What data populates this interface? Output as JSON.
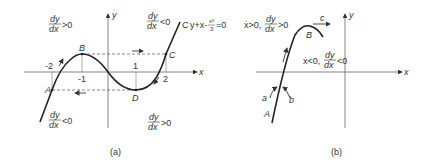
{
  "figure_a": {
    "caption": "(a)",
    "axis_x": "x",
    "axis_y": "y",
    "ticks": [
      "-2",
      "-1",
      "1",
      "2"
    ],
    "points": [
      "A",
      "B",
      "C",
      "D"
    ],
    "curve_label": "C: y+x-x³/3=0",
    "curve_symbol": "C",
    "equation_text": "y+x-",
    "equation_frac_num": "x³",
    "equation_frac_den": "3",
    "equation_tail": "=0",
    "regions": [
      {
        "num": "dy",
        "den": "dx",
        "rel": ">0"
      },
      {
        "num": "dy",
        "den": "dx",
        "rel": "<0"
      },
      {
        "num": "dy",
        "den": "dx",
        "rel": "<0"
      },
      {
        "num": "dy",
        "den": "dx",
        "rel": ">0"
      }
    ]
  },
  "figure_b": {
    "caption": "(b)",
    "axis_x": "x",
    "axis_y": "y",
    "points": [
      "A",
      "B"
    ],
    "markers": [
      "a",
      "b",
      "c"
    ],
    "region_upper": {
      "prefix": "ẋ>0,",
      "num": "dy",
      "den": "dx",
      "rel": ">0"
    },
    "region_lower": {
      "prefix": "ẋ<0,",
      "num": "dy",
      "den": "dx",
      "rel": "<0"
    }
  }
}
